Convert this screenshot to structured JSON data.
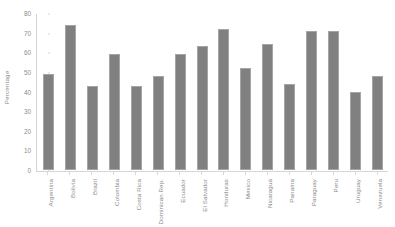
{
  "chart_data": {
    "type": "bar",
    "title": "",
    "xlabel": "",
    "ylabel": "Percentage",
    "ylim": [
      0,
      80
    ],
    "yticks": [
      0,
      10,
      20,
      30,
      40,
      50,
      60,
      70,
      80
    ],
    "grid": false,
    "legend": "none",
    "bar_color": "#808080",
    "bar_edge_color": "#a5a5a5",
    "axis_color": "#d6d6d6",
    "text_color": "#8a8a8a",
    "background": "#ffffff",
    "categories": [
      "Argentina",
      "Bolivia",
      "Brazil",
      "Colombia",
      "Costa Rica",
      "Dominican Rep.",
      "Ecuador",
      "El Salvador",
      "Honduras",
      "Mexico",
      "Nicaragua",
      "Panama",
      "Paraguay",
      "Peru",
      "Uruguay",
      "Venezuela"
    ],
    "values": [
      49,
      74,
      43,
      59,
      43,
      48,
      59,
      63,
      72,
      52,
      64,
      44,
      71,
      71,
      40,
      48
    ]
  }
}
